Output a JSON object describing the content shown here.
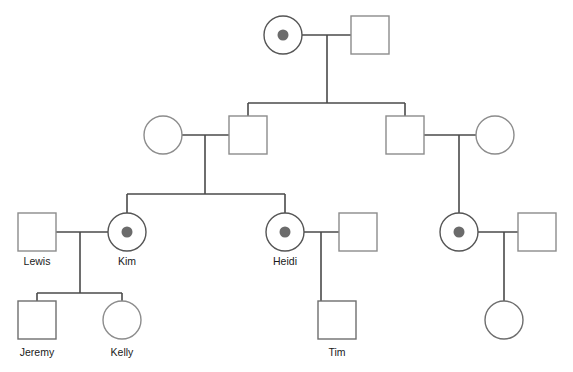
{
  "figure": {
    "kind": "pedigree-chart",
    "title": "",
    "width": 573,
    "height": 372,
    "background": "#ffffff"
  },
  "legend_colors": {
    "line": "#4a4a4a",
    "outline_light": "#8c8c8c",
    "outline_dark": "#6e6e6e",
    "carrier_dot": "#6b6b6b",
    "affected_light": "#808080",
    "affected_dark": "#5e5e5e",
    "unaffected_fill": "#ffffff",
    "label_text": "#1a1a1a"
  },
  "chart_data": {
    "type": "diagram",
    "subtype": "pedigree",
    "generations": 4,
    "individuals": [
      {
        "id": "I-1",
        "generation": 1,
        "sex": "female",
        "status": "carrier",
        "shape": "circle",
        "fill": "#ffffff",
        "dot": "#6b6b6b",
        "label": "",
        "cx": 283,
        "cy": 35,
        "r": 19
      },
      {
        "id": "I-2",
        "generation": 1,
        "sex": "male",
        "status": "unaffected",
        "shape": "square",
        "fill": "#ffffff",
        "label": "",
        "cx": 370,
        "cy": 35,
        "size": 38
      },
      {
        "id": "II-1",
        "generation": 2,
        "sex": "female",
        "status": "unaffected",
        "shape": "circle",
        "fill": "#ffffff",
        "label": "",
        "cx": 163,
        "cy": 135,
        "r": 19
      },
      {
        "id": "II-2",
        "generation": 2,
        "sex": "male",
        "status": "unaffected",
        "shape": "square",
        "fill": "#ffffff",
        "label": "",
        "cx": 248,
        "cy": 135,
        "size": 38
      },
      {
        "id": "II-3",
        "generation": 2,
        "sex": "male",
        "status": "unaffected",
        "shape": "square",
        "fill": "#ffffff",
        "label": "",
        "cx": 405,
        "cy": 135,
        "size": 38
      },
      {
        "id": "II-4",
        "generation": 2,
        "sex": "female",
        "status": "unaffected",
        "shape": "circle",
        "fill": "#ffffff",
        "label": "",
        "cx": 495,
        "cy": 135,
        "r": 19
      },
      {
        "id": "III-1",
        "generation": 3,
        "sex": "male",
        "status": "unaffected",
        "shape": "square",
        "fill": "#ffffff",
        "label": "Lewis",
        "cx": 37,
        "cy": 232,
        "size": 38
      },
      {
        "id": "III-2",
        "generation": 3,
        "sex": "female",
        "status": "carrier",
        "shape": "circle",
        "fill": "#ffffff",
        "dot": "#6b6b6b",
        "label": "Kim",
        "cx": 127,
        "cy": 232,
        "r": 19
      },
      {
        "id": "III-3",
        "generation": 3,
        "sex": "female",
        "status": "carrier",
        "shape": "circle",
        "fill": "#ffffff",
        "dot": "#6b6b6b",
        "label": "Heidi",
        "cx": 285,
        "cy": 232,
        "r": 19
      },
      {
        "id": "III-4",
        "generation": 3,
        "sex": "male",
        "status": "unaffected",
        "shape": "square",
        "fill": "#ffffff",
        "label": "",
        "cx": 358,
        "cy": 232,
        "size": 38
      },
      {
        "id": "III-5",
        "generation": 3,
        "sex": "female",
        "status": "carrier",
        "shape": "circle",
        "fill": "#ffffff",
        "dot": "#6b6b6b",
        "label": "",
        "cx": 459,
        "cy": 232,
        "r": 19
      },
      {
        "id": "III-6",
        "generation": 3,
        "sex": "male",
        "status": "unaffected",
        "shape": "square",
        "fill": "#ffffff",
        "label": "",
        "cx": 537,
        "cy": 232,
        "size": 38
      },
      {
        "id": "IV-1",
        "generation": 4,
        "sex": "male",
        "status": "affected",
        "shape": "square",
        "fill": "#808080",
        "label": "Jeremy",
        "cx": 37,
        "cy": 320,
        "size": 38
      },
      {
        "id": "IV-2",
        "generation": 4,
        "sex": "female",
        "status": "unaffected",
        "shape": "circle",
        "fill": "#ffffff",
        "label": "Kelly",
        "cx": 122,
        "cy": 320,
        "r": 19
      },
      {
        "id": "IV-3",
        "generation": 4,
        "sex": "male",
        "status": "affected",
        "shape": "square",
        "fill": "#5e5e5e",
        "label": "Tim",
        "cx": 337,
        "cy": 320,
        "size": 38
      },
      {
        "id": "IV-4",
        "generation": 4,
        "sex": "female",
        "status": "affected",
        "shape": "circle",
        "fill": "#5e5e5e",
        "label": "",
        "cx": 504,
        "cy": 320,
        "r": 19
      }
    ],
    "labels": [
      {
        "text": "Lewis",
        "x": 37,
        "y": 265
      },
      {
        "text": "Kim",
        "x": 127,
        "y": 265
      },
      {
        "text": "Heidi",
        "x": 285,
        "y": 265
      },
      {
        "text": "Jeremy",
        "x": 37,
        "y": 356
      },
      {
        "text": "Kelly",
        "x": 122,
        "y": 356
      },
      {
        "text": "Tim",
        "x": 337,
        "y": 356
      }
    ],
    "matings": [
      {
        "id": "m1",
        "partners": [
          "I-1",
          "I-2"
        ],
        "y": 35,
        "x1": 302,
        "x2": 351,
        "descent_x": 327
      },
      {
        "id": "m2",
        "partners": [
          "II-1",
          "II-2"
        ],
        "y": 135,
        "x1": 182,
        "x2": 229,
        "descent_x": 205
      },
      {
        "id": "m3",
        "partners": [
          "II-3",
          "II-4"
        ],
        "y": 135,
        "x1": 424,
        "x2": 476,
        "descent_x": 459
      },
      {
        "id": "m4",
        "partners": [
          "III-1",
          "III-2"
        ],
        "y": 232,
        "x1": 56,
        "x2": 108,
        "descent_x": 80
      },
      {
        "id": "m5",
        "partners": [
          "III-3",
          "III-4"
        ],
        "y": 232,
        "x1": 304,
        "x2": 339,
        "descent_x": 321
      },
      {
        "id": "m6",
        "partners": [
          "III-5",
          "III-6"
        ],
        "y": 232,
        "x1": 478,
        "x2": 518,
        "descent_x": 504
      }
    ],
    "sibships": [
      {
        "id": "s1",
        "parents": "m1",
        "bar_y": 103,
        "bar_x1": 248,
        "bar_x2": 405,
        "drop_x": 327,
        "drop_from_y": 35,
        "children": [
          "II-2",
          "II-3"
        ]
      },
      {
        "id": "s2",
        "parents": "m2",
        "bar_y": 194,
        "bar_x1": 127,
        "bar_x2": 285,
        "drop_x": 205,
        "drop_from_y": 135,
        "children": [
          "III-2",
          "III-3"
        ]
      },
      {
        "id": "s3",
        "parents": "m3",
        "bar_y": null,
        "drop_x": 459,
        "drop_from_y": 135,
        "children": [
          "III-5"
        ]
      },
      {
        "id": "s4",
        "parents": "m4",
        "bar_y": 293,
        "bar_x1": 37,
        "bar_x2": 122,
        "drop_x": 80,
        "drop_from_y": 232,
        "children": [
          "IV-1",
          "IV-2"
        ]
      },
      {
        "id": "s5",
        "parents": "m5",
        "bar_y": null,
        "drop_x": 321,
        "drop_from_y": 232,
        "children": [
          "IV-3"
        ]
      },
      {
        "id": "s6",
        "parents": "m6",
        "bar_y": null,
        "drop_x": 504,
        "drop_from_y": 232,
        "children": [
          "IV-4"
        ]
      }
    ]
  }
}
